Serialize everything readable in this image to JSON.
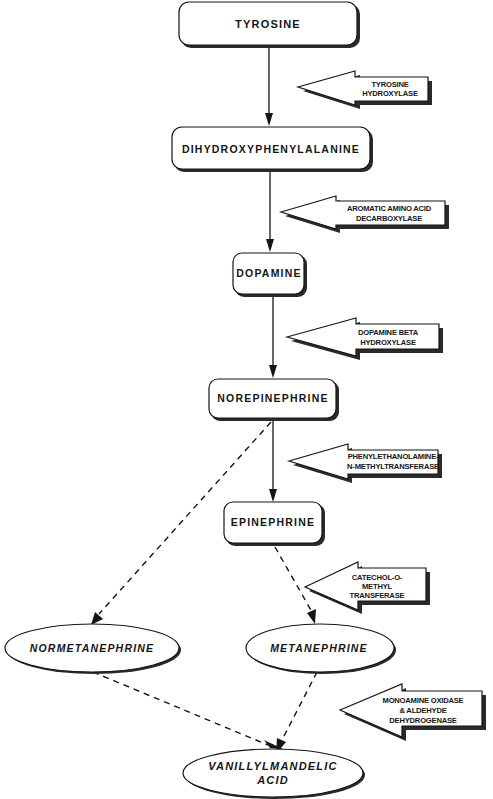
{
  "colors": {
    "ink": "#151515",
    "background": "#ffffff",
    "shadow": "#2a2a2a"
  },
  "nodes": {
    "tyrosine": {
      "label": "TYROSINE",
      "shape": "rounded-rect"
    },
    "dopa": {
      "label": "DIHYDROXYPHENYLALANINE",
      "shape": "rounded-rect"
    },
    "dopamine": {
      "label": "DOPAMINE",
      "shape": "rounded-rect"
    },
    "norepinephrine": {
      "label": "NOREPINEPHRINE",
      "shape": "rounded-rect"
    },
    "epinephrine": {
      "label": "EPINEPHRINE",
      "shape": "rounded-rect"
    },
    "normetanephrine": {
      "label": "NORMETANEPHRINE",
      "shape": "ellipse"
    },
    "metanephrine": {
      "label": "METANEPHRINE",
      "shape": "ellipse"
    },
    "vma": {
      "line1": "VANILLYLMANDELIC",
      "line2": "ACID",
      "shape": "ellipse"
    }
  },
  "enzymes": {
    "tyrosine_hydroxylase": {
      "line1": "TYROSINE",
      "line2": "HYDROXYLASE"
    },
    "aadc": {
      "line1": "AROMATIC AMINO ACID",
      "line2": "DECARBOXYLASE"
    },
    "dbh": {
      "line1": "DOPAMINE BETA",
      "line2": "HYDROXYLASE"
    },
    "pnmt": {
      "line1": "PHENYLETHANOLAMINE-",
      "line2": "N-METHYLTRANSFERASE"
    },
    "comt": {
      "line1": "CATECHOL-O-",
      "line2": "METHYL",
      "line3": "TRANSFERASE"
    },
    "mao_aldh": {
      "line1": "MONOAMINE OXIDASE",
      "line2": "& ALDEHYDE",
      "line3": "DEHYDROGENASE"
    }
  },
  "edges": [
    {
      "from": "TYROSINE",
      "to": "DIHYDROXYPHENYLALANINE",
      "style": "solid"
    },
    {
      "from": "DIHYDROXYPHENYLALANINE",
      "to": "DOPAMINE",
      "style": "solid"
    },
    {
      "from": "DOPAMINE",
      "to": "NOREPINEPHRINE",
      "style": "solid"
    },
    {
      "from": "NOREPINEPHRINE",
      "to": "EPINEPHRINE",
      "style": "solid"
    },
    {
      "from": "NOREPINEPHRINE",
      "to": "NORMETANEPHRINE",
      "style": "dashed"
    },
    {
      "from": "EPINEPHRINE",
      "to": "METANEPHRINE",
      "style": "dashed"
    },
    {
      "from": "NORMETANEPHRINE",
      "to": "VANILLYLMANDELIC ACID",
      "style": "dashed"
    },
    {
      "from": "METANEPHRINE",
      "to": "VANILLYLMANDELIC ACID",
      "style": "dashed"
    }
  ]
}
